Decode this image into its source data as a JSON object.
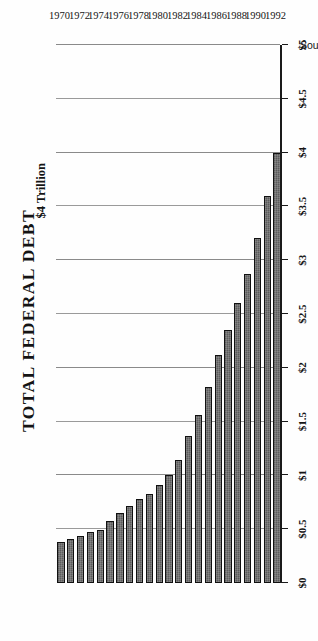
{
  "chart_data": {
    "type": "bar",
    "title": "TOTAL FEDERAL DEBT",
    "xlabel": "",
    "ylabel": "Trillions of Dollars",
    "orientation": "horizontal-rotated",
    "grid": true,
    "legend": null,
    "ylim": [
      0,
      5
    ],
    "ytick_labels": [
      "$0",
      "$1",
      "$1",
      "$2",
      "$2",
      "$3",
      "$3",
      "$4",
      "$4",
      "$5"
    ],
    "ytick_values": [
      0,
      0.5,
      1.0,
      1.5,
      2.0,
      2.5,
      3.0,
      3.5,
      4.0,
      4.5,
      5.0
    ],
    "ytick_labels_full": [
      "$0",
      "$0.5",
      "$1",
      "$1.5",
      "$2",
      "$2.5",
      "$3",
      "$3.5",
      "$4",
      "$4.5",
      "$5"
    ],
    "categories": [
      "1970",
      "1971",
      "1972",
      "1973",
      "1974",
      "1975",
      "1976",
      "1977",
      "1978",
      "1979",
      "1980",
      "1981",
      "1982",
      "1983",
      "1984",
      "1985",
      "1986",
      "1987",
      "1988",
      "1989",
      "1990",
      "1991",
      "1992"
    ],
    "xtick_labels": [
      "1970",
      "1972",
      "1974",
      "1976",
      "1978",
      "1980",
      "1982",
      "1984",
      "1986",
      "1988",
      "1990",
      "1992"
    ],
    "values": [
      0.38,
      0.41,
      0.44,
      0.47,
      0.49,
      0.58,
      0.65,
      0.72,
      0.78,
      0.83,
      0.91,
      1.0,
      1.14,
      1.37,
      1.56,
      1.82,
      2.12,
      2.35,
      2.6,
      2.87,
      3.21,
      3.6,
      4.0
    ],
    "annotations": [
      {
        "text": "$4 Trillion",
        "value": 4.0,
        "category": "1992"
      }
    ],
    "source_note": "Source: OMB",
    "bar_color": "#5b5b5b",
    "bar_edge_color": "#111111",
    "grid_color": "#9a9a9a",
    "background_color": "#fefefe"
  },
  "figure": {
    "title": "TOTAL FEDERAL DEBT",
    "axis_caption": "Trillions of Dollars",
    "callout": "$4 Trillion",
    "source": "Source: OMB"
  }
}
